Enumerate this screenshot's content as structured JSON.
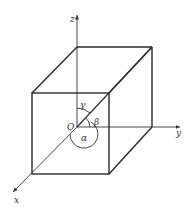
{
  "diagram": {
    "type": "3d-cube-direction-angles",
    "axes": {
      "x": "x",
      "y": "y",
      "z": "z"
    },
    "origin_label": "O",
    "angles": {
      "alpha": "α",
      "beta": "β",
      "gamma": "γ"
    },
    "colors": {
      "line": "#2a2a2a",
      "background": "#ffffff"
    }
  }
}
